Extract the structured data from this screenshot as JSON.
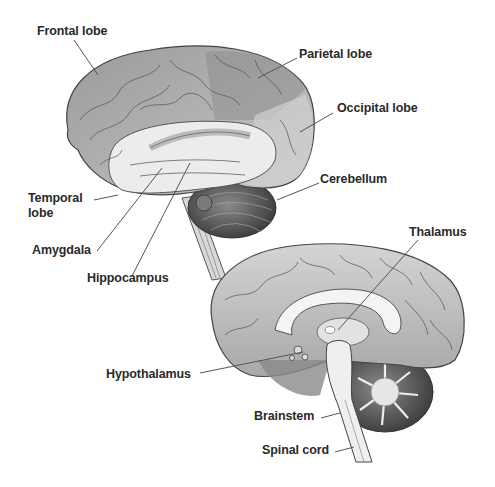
{
  "diagram": {
    "type": "anatomical-illustration",
    "views": [
      {
        "name": "lateral-view",
        "labels": [
          {
            "id": "frontal",
            "text": "Frontal lobe"
          },
          {
            "id": "parietal",
            "text": "Parietal lobe"
          },
          {
            "id": "occipital",
            "text": "Occipital lobe"
          },
          {
            "id": "cerebellum",
            "text": "Cerebellum"
          },
          {
            "id": "temporal",
            "text": "Temporal",
            "text2": "lobe"
          },
          {
            "id": "amygdala",
            "text": "Amygdala"
          },
          {
            "id": "hippocampus",
            "text": "Hippocampus"
          }
        ]
      },
      {
        "name": "sagittal-view",
        "labels": [
          {
            "id": "thalamus",
            "text": "Thalamus"
          },
          {
            "id": "hypothalamus",
            "text": "Hypothalamus"
          },
          {
            "id": "brainstem",
            "text": "Brainstem"
          },
          {
            "id": "spinal_cord",
            "text": "Spinal cord"
          }
        ]
      }
    ],
    "colors": {
      "background": "#ffffff",
      "label_text": "#2a2a2a",
      "leader_line": "#555555",
      "cortex": "#b8b8b8",
      "cortex_dark": "#7a7a7a",
      "temporal_light": "#e6e6e6",
      "cerebellum": "#5a5a5a"
    }
  }
}
